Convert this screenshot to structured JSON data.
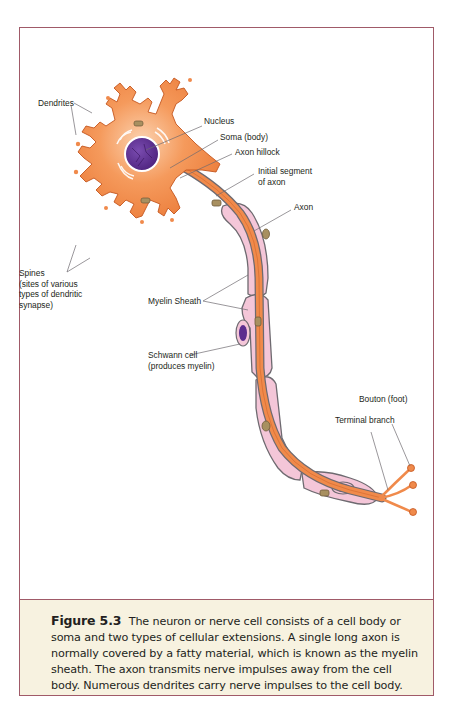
{
  "figure": {
    "labels": {
      "dendrites": "Dendrites",
      "nucleus": "Nucleus",
      "soma": "Soma (body)",
      "axon_hillock": "Axon hillock",
      "initial_segment_line1": "Initial segment",
      "initial_segment_line2": "of axon",
      "axon": "Axon",
      "spines_line1": "Spines",
      "spines_line2": "(sites of various",
      "spines_line3": "types of dendritic",
      "spines_line4": "synapse)",
      "myelin_sheath": "Myelin Sheath",
      "schwann_line1": "Schwann cell",
      "schwann_line2": "(produces myelin)",
      "bouton": "Bouton (foot)",
      "terminal_branch": "Terminal branch"
    },
    "colors": {
      "frame_border": "#a05a68",
      "caption_bg": "#f7f2e0",
      "cell_orange": "#f08a4b",
      "nucleus_purple": "#5b2d8e",
      "myelin_pink": "#f4c6d8",
      "outline_gray": "#6e6a70"
    }
  },
  "caption": {
    "figure_number": "Figure 5.3",
    "text": "The neuron or nerve cell consists of a cell body or soma and two types of cellular extensions. A single long axon is normally covered by a fatty material, which is known as the myelin sheath. The axon transmits nerve impulses away from the cell body. Numerous dendrites carry nerve impulses to the cell body."
  }
}
